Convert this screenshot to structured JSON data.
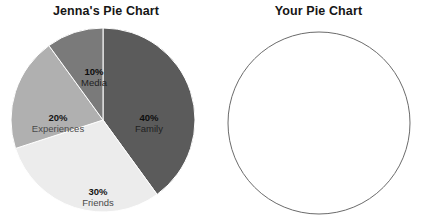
{
  "chart_data": [
    {
      "type": "pie",
      "title": "Jenna's Pie Chart",
      "categories": [
        "Family",
        "Friends",
        "Experiences",
        "Media"
      ],
      "values": [
        40,
        30,
        20,
        10
      ],
      "value_labels": [
        "40%",
        "30%",
        "20%",
        "10%"
      ],
      "colors": [
        "#5b5b5b",
        "#ececec",
        "#b0b0b0",
        "#7a7a7a"
      ],
      "start_angle_deg": 0,
      "direction": "clockwise",
      "labels_inside": true,
      "legend": "none",
      "grid": false,
      "xlabel": "",
      "ylabel": ""
    },
    {
      "type": "pie",
      "title": "Your Pie Chart",
      "categories": [],
      "values": [],
      "value_labels": [],
      "colors": [],
      "empty": true,
      "outline_color": "#6b6b6b",
      "fill_color": "#ffffff",
      "legend": "none",
      "grid": false,
      "xlabel": "",
      "ylabel": ""
    }
  ],
  "left_chart": {
    "title": "Jenna's Pie Chart",
    "slices": [
      {
        "percent": "40%",
        "name": "Family",
        "color": "#5b5b5b",
        "label_x": 139,
        "label_y": 97,
        "tone": "dark"
      },
      {
        "percent": "30%",
        "name": "Friends",
        "color": "#ececec",
        "label_x": 88,
        "label_y": 171,
        "tone": "light"
      },
      {
        "percent": "20%",
        "name": "Experiences",
        "color": "#b0b0b0",
        "label_x": 48,
        "label_y": 97,
        "tone": "light"
      },
      {
        "percent": "10%",
        "name": "Media",
        "color": "#7a7a7a",
        "label_x": 84,
        "label_y": 51,
        "tone": "dark"
      }
    ]
  },
  "right_chart": {
    "title": "Your Pie Chart"
  }
}
